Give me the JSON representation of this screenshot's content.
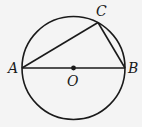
{
  "diagram": {
    "type": "geometry",
    "colors": {
      "background": "#f4f4f4",
      "stroke": "#1a1a1a"
    },
    "circle": {
      "cx": 73.5,
      "cy": 68,
      "r": 51.5,
      "center_label": "O"
    },
    "points": [
      {
        "id": "A",
        "label": "A",
        "x": 22,
        "y": 68,
        "label_x": 8,
        "label_y": 73
      },
      {
        "id": "B",
        "label": "B",
        "x": 125,
        "y": 68,
        "label_x": 128,
        "label_y": 73
      },
      {
        "id": "C",
        "label": "C",
        "x": 98,
        "y": 22.5,
        "label_x": 96,
        "label_y": 16
      },
      {
        "id": "O",
        "label": "O",
        "x": 73.5,
        "y": 68,
        "label_x": 67,
        "label_y": 86
      }
    ],
    "segments": [
      {
        "from": "A",
        "to": "B",
        "name": "diameter-ab"
      },
      {
        "from": "A",
        "to": "C",
        "name": "chord-ac"
      },
      {
        "from": "C",
        "to": "B",
        "name": "chord-cb"
      }
    ]
  }
}
